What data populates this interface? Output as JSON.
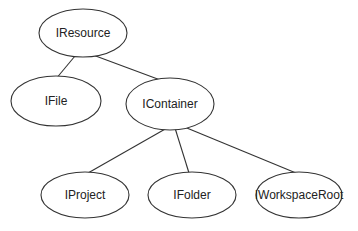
{
  "diagram": {
    "type": "tree",
    "nodes": [
      {
        "id": "iresource",
        "label": "IResource",
        "cx": 83,
        "cy": 33,
        "rx": 44,
        "ry": 24
      },
      {
        "id": "ifile",
        "label": "IFile",
        "cx": 56,
        "cy": 101,
        "rx": 45,
        "ry": 25
      },
      {
        "id": "icontainer",
        "label": "IContainer",
        "cx": 170,
        "cy": 104,
        "rx": 44,
        "ry": 26
      },
      {
        "id": "iproject",
        "label": "IProject",
        "cx": 85,
        "cy": 195,
        "rx": 44,
        "ry": 23
      },
      {
        "id": "ifolder",
        "label": "IFolder",
        "cx": 192,
        "cy": 195,
        "rx": 44,
        "ry": 23
      },
      {
        "id": "iworkspaceroot",
        "label": "IWorkspaceRoot",
        "cx": 299,
        "cy": 195,
        "rx": 43,
        "ry": 23
      }
    ],
    "edges": [
      {
        "from": "iresource",
        "to": "ifile",
        "x1": 75,
        "y1": 56,
        "x2": 55,
        "y2": 80
      },
      {
        "from": "iresource",
        "to": "icontainer",
        "x1": 93,
        "y1": 55,
        "x2": 163,
        "y2": 81
      },
      {
        "from": "icontainer",
        "to": "iproject",
        "x1": 167,
        "y1": 128,
        "x2": 88,
        "y2": 173
      },
      {
        "from": "icontainer",
        "to": "ifolder",
        "x1": 175,
        "y1": 128,
        "x2": 189,
        "y2": 173
      },
      {
        "from": "icontainer",
        "to": "iworkspaceroot",
        "x1": 182,
        "y1": 126,
        "x2": 296,
        "y2": 173
      }
    ]
  }
}
